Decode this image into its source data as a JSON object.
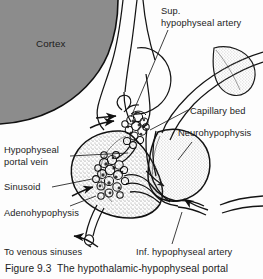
{
  "figure": {
    "caption": "Figure 9.3  The hypothalamic-hypophyseal portal",
    "width": 263,
    "height": 279
  },
  "colors": {
    "background": "#fdfdfd",
    "cortex_fill": "#8c8c8c",
    "ink": "#1c1c1c",
    "stipple": "#6e6e6e",
    "outline": "#121212"
  },
  "labels": {
    "cortex": "Cortex",
    "superior_hypophyseal_artery": "Sup.\nhypophyseal artery",
    "capillary_bed": "Capillary bed",
    "neurohypophysis": "Neurohypophysis",
    "hypophyseal_portal_vein": "Hypophyseal\nportal vein",
    "sinusoid": "Sinusoid",
    "adenohypophysis": "Adenohypophysis",
    "to_venous_sinuses": "To venous sinuses",
    "inferior_hypophyseal_artery": "Inf. hypophyseal artery"
  },
  "structures": {
    "cortex_region": "cerebral-cortex-gray-mass",
    "infundibulum": "infundibular-stalk",
    "primary_plexus": "primary-capillary-plexus",
    "secondary_plexus": "secondary-capillary-plexus-sinusoids",
    "anterior_lobe": "adenohypophysis-anterior-lobe",
    "posterior_lobe": "neurohypophysis-posterior-lobe",
    "crescent": "median-eminence-crescent",
    "portal_vessel": "hypophyseal-portal-vein-channel",
    "drain_vessel": "venous-drainage-vessel"
  }
}
